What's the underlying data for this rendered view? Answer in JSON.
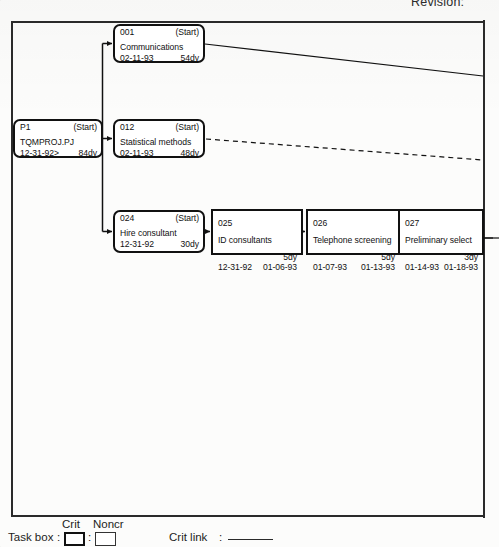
{
  "header": {
    "revision_text": "Revision:"
  },
  "diagram": {
    "type": "pert-network-chart",
    "boxes": [
      {
        "id": "001",
        "id_label": "001",
        "status": "(Start)",
        "name": "Communications",
        "start_date": "02-11-93",
        "duration": "54dy",
        "finish_date": "",
        "critical": true,
        "layout": "three-line"
      },
      {
        "id": "P1",
        "id_label": "P1",
        "status": "(Start)",
        "name": "TQMPROJ.PJ",
        "start_date": "12-31-92>",
        "duration": "84dy",
        "finish_date": "",
        "critical": true,
        "layout": "three-line"
      },
      {
        "id": "012",
        "id_label": "012",
        "status": "(Start)",
        "name": "Statistical methods",
        "start_date": "02-11-93",
        "duration": "48dy",
        "finish_date": "",
        "critical": true,
        "layout": "three-line"
      },
      {
        "id": "024",
        "id_label": "024",
        "status": "(Start)",
        "name": "Hire consultant",
        "start_date": "12-31-92",
        "duration": "30dy",
        "finish_date": "",
        "critical": true,
        "layout": "three-line"
      },
      {
        "id": "025",
        "id_label": "025",
        "status": "",
        "name": "ID consultants",
        "duration": "5dy",
        "start_date": "12-31-92",
        "finish_date": "01-06-93",
        "critical": true,
        "layout": "four-line"
      },
      {
        "id": "026",
        "id_label": "026",
        "status": "",
        "name": "Telephone screening",
        "duration": "5dy",
        "start_date": "01-07-93",
        "finish_date": "01-13-93",
        "critical": true,
        "layout": "four-line"
      },
      {
        "id": "027",
        "id_label": "027",
        "status": "",
        "name": "Preliminary select",
        "duration": "3dy",
        "start_date": "01-14-93",
        "finish_date": "01-18-93",
        "critical": true,
        "layout": "four-line"
      }
    ],
    "links": [
      {
        "from": "P1",
        "to": "001",
        "style": "solid"
      },
      {
        "from": "P1",
        "to": "012",
        "style": "solid"
      },
      {
        "from": "P1",
        "to": "024",
        "style": "solid"
      },
      {
        "from": "001",
        "to": "offpage-right",
        "style": "solid"
      },
      {
        "from": "012",
        "to": "offpage-right",
        "style": "dashed"
      },
      {
        "from": "024",
        "to": "025",
        "style": "solid"
      },
      {
        "from": "025",
        "to": "026",
        "style": "solid"
      },
      {
        "from": "026",
        "to": "027",
        "style": "solid"
      },
      {
        "from": "027",
        "to": "offpage-right",
        "style": "solid"
      }
    ]
  },
  "legend": {
    "task_box_label": "Task box",
    "crit_label": "Crit",
    "noncr_label": "Noncr",
    "crit_link_label": "Crit link",
    "colon": ":"
  },
  "colors": {
    "ink": "#111111",
    "frame": "#2a2a2a",
    "paper": "#fcfcfb"
  }
}
